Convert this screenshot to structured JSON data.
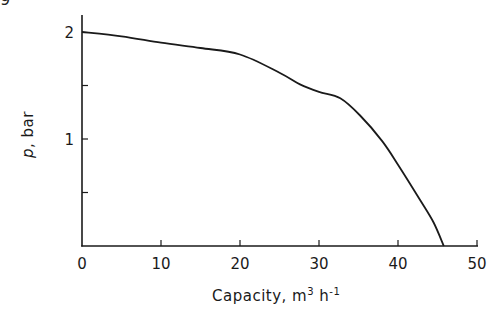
{
  "corner_fragment": "9",
  "chart_data": {
    "type": "line",
    "title": "",
    "xlabel": "Capacity, m³ h⁻¹",
    "xlabel_parts": {
      "main": "Capacity,  m",
      "sup1": "3",
      "mid": " h",
      "sup2": "-1"
    },
    "ylabel": "p, bar",
    "ylabel_parts": {
      "var": "p",
      "rest": ", bar"
    },
    "xlim": [
      0,
      50
    ],
    "ylim": [
      0,
      2.2
    ],
    "x_ticks": [
      0,
      10,
      20,
      30,
      40,
      50
    ],
    "x_tick_labels": [
      "0",
      "10",
      "20",
      "30",
      "40",
      "50"
    ],
    "y_ticks": [
      0.5,
      1,
      1.5,
      2
    ],
    "y_tick_labels": {
      "1": "1",
      "2": "2"
    },
    "grid": false,
    "legend": null,
    "series": [
      {
        "name": "pump characteristic",
        "x": [
          0,
          5,
          10,
          15,
          20,
          25,
          27.6,
          30,
          32.7,
          35.2,
          38,
          40,
          42.8,
          44.5,
          45.8
        ],
        "y": [
          2.0,
          1.96,
          1.9,
          1.85,
          1.79,
          1.62,
          1.51,
          1.44,
          1.38,
          1.22,
          0.98,
          0.76,
          0.43,
          0.22,
          0.0
        ]
      }
    ]
  }
}
